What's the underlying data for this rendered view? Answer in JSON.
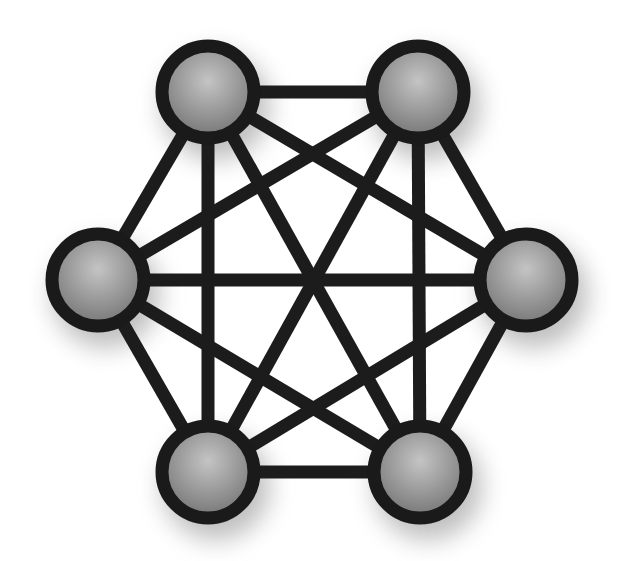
{
  "diagram": {
    "type": "complete-graph",
    "title": "",
    "colors": {
      "background": "#ffffff",
      "edge": "#1c1c1c",
      "node_stroke": "#1a1a1a",
      "node_fill_light": "#bdbdbd",
      "node_fill_dark": "#7a7a7a",
      "shadow": "#8a8a8a"
    },
    "node_radius": 46,
    "node_stroke_width": 13,
    "edge_width": 13,
    "nodes": [
      {
        "id": "n1",
        "name": "top-left",
        "x": 208,
        "y": 92
      },
      {
        "id": "n2",
        "name": "top-right",
        "x": 418,
        "y": 92
      },
      {
        "id": "n3",
        "name": "left",
        "x": 98,
        "y": 280
      },
      {
        "id": "n4",
        "name": "right",
        "x": 526,
        "y": 280
      },
      {
        "id": "n5",
        "name": "bottom-left",
        "x": 208,
        "y": 472
      },
      {
        "id": "n6",
        "name": "bottom-right",
        "x": 420,
        "y": 472
      }
    ],
    "edges": [
      [
        "n1",
        "n2"
      ],
      [
        "n1",
        "n3"
      ],
      [
        "n1",
        "n4"
      ],
      [
        "n1",
        "n5"
      ],
      [
        "n1",
        "n6"
      ],
      [
        "n2",
        "n3"
      ],
      [
        "n2",
        "n4"
      ],
      [
        "n2",
        "n5"
      ],
      [
        "n2",
        "n6"
      ],
      [
        "n3",
        "n4"
      ],
      [
        "n3",
        "n5"
      ],
      [
        "n3",
        "n6"
      ],
      [
        "n4",
        "n5"
      ],
      [
        "n4",
        "n6"
      ],
      [
        "n5",
        "n6"
      ]
    ]
  }
}
